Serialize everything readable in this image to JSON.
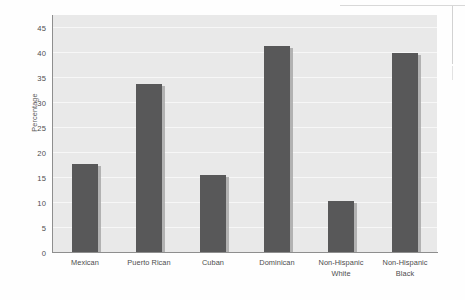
{
  "chart_data": {
    "type": "bar",
    "title": "",
    "subtitle": "",
    "xlabel": "",
    "ylabel": "Percentage",
    "ylim": [
      0,
      47.5
    ],
    "grid": true,
    "grid_axis": "y",
    "legend": null,
    "legend_position": "none",
    "categories": [
      "Mexican",
      "Puerto Rican",
      "Cuban",
      "Dominican",
      "Non-Hispanic White",
      "Non-Hispanic Black"
    ],
    "category_lines": [
      [
        "Mexican"
      ],
      [
        "Puerto Rican"
      ],
      [
        "Cuban"
      ],
      [
        "Dominican"
      ],
      [
        "Non-Hispanic",
        "White"
      ],
      [
        "Non-Hispanic",
        "Black"
      ]
    ],
    "values": [
      17.8,
      33.7,
      15.5,
      41.3,
      10.3,
      40.0
    ],
    "yticks": [
      0,
      5,
      10,
      15,
      20,
      25,
      30,
      35,
      40,
      45
    ],
    "ytick_labels": [
      "0",
      "5",
      "10",
      "15",
      "20",
      "25",
      "30",
      "35",
      "40",
      "45"
    ],
    "bar_color": "#585859",
    "bar_shadow_color": "#a8a8a8",
    "plot_background": "#e9e9e9",
    "gridline_color": "#f7f7f7",
    "axis_color": "#8e8e8e",
    "text_color": "#4d4d4d",
    "page_background": "#fefefe"
  }
}
